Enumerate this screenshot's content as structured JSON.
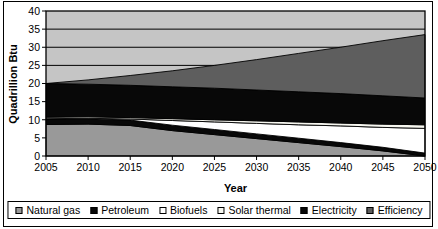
{
  "chart_data": {
    "type": "area",
    "stacked": true,
    "title": "",
    "xlabel": "Year",
    "ylabel": "Quadrillion Btu",
    "ylim": [
      0,
      40
    ],
    "grid": true,
    "legend_position": "bottom",
    "plot_bg": "#c5c5c5",
    "border_color": "#000000",
    "x": [
      2005,
      2010,
      2015,
      2020,
      2025,
      2030,
      2035,
      2040,
      2045,
      2050
    ],
    "x_ticks": [
      "2005",
      "2010",
      "2015",
      "2020",
      "2025",
      "2030",
      "2035",
      "2040",
      "2045",
      "2050"
    ],
    "y_ticks": [
      "0",
      "5",
      "10",
      "15",
      "20",
      "25",
      "30",
      "35",
      "40"
    ],
    "series": [
      {
        "name": "Natural gas",
        "color": "#999999",
        "values": [
          8.7,
          8.8,
          8.4,
          7.0,
          5.9,
          4.8,
          3.7,
          2.6,
          1.4,
          0.0
        ]
      },
      {
        "name": "Petroleum",
        "color": "#080808",
        "values": [
          1.5,
          1.5,
          1.5,
          1.5,
          1.4,
          1.3,
          1.2,
          1.1,
          1.0,
          0.8
        ]
      },
      {
        "name": "Biofuels",
        "color": "#ffffff",
        "values": [
          0.1,
          0.1,
          0.3,
          1.3,
          2.1,
          2.9,
          3.7,
          4.6,
          5.5,
          6.8
        ]
      },
      {
        "name": "Solar thermal",
        "color": "#f7f7f0",
        "values": [
          0.4,
          0.4,
          0.4,
          0.5,
          0.6,
          0.7,
          0.8,
          0.8,
          0.9,
          1.0
        ]
      },
      {
        "name": "Electricity",
        "color": "#080808",
        "values": [
          9.3,
          9.0,
          8.9,
          8.8,
          8.7,
          8.5,
          8.3,
          8.1,
          7.8,
          7.4
        ]
      },
      {
        "name": "Efficiency",
        "color": "#5e5e5e",
        "values": [
          0.0,
          1.2,
          2.7,
          4.4,
          6.3,
          8.4,
          10.6,
          12.8,
          15.2,
          17.5
        ]
      }
    ]
  }
}
